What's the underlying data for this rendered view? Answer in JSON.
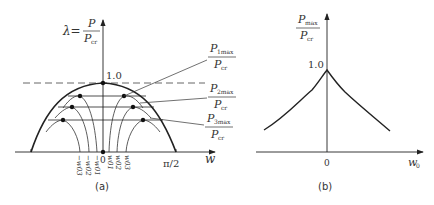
{
  "panel_a": {
    "caption": "(a)",
    "y_axis_label": {
      "lhs": "λ=",
      "num": "P",
      "den": "P",
      "den_sub": "cr"
    },
    "x_axis_label": "w",
    "peak_value_label": "1.0",
    "x_right_tick_label": "π/2",
    "origin_label": "0",
    "w0_tick_labels_negative": [
      "−w03",
      "−w02",
      "−w01"
    ],
    "w0_tick_labels_positive": [
      "w01",
      "w02",
      "w03"
    ],
    "w0_tick_label_base": "w",
    "w0_tick_subs": [
      "03",
      "02",
      "01",
      "01",
      "02",
      "03"
    ],
    "callouts": [
      {
        "num": "P",
        "num_sub": "1max",
        "den": "P",
        "den_sub": "cr"
      },
      {
        "num": "P",
        "num_sub": "2max",
        "den": "P",
        "den_sub": "cr"
      },
      {
        "num": "P",
        "num_sub": "3max",
        "den": "P",
        "den_sub": "cr"
      }
    ]
  },
  "panel_b": {
    "caption": "(b)",
    "y_axis_label": {
      "num": "P",
      "num_sub": "max",
      "den": "P",
      "den_sub": "cr"
    },
    "x_axis_label": "w",
    "x_axis_label_sub": "0",
    "peak_value_label": "1.0",
    "origin_label": "0"
  },
  "colors": {
    "line": "#222222",
    "text": "#333333",
    "dash": "#555555"
  }
}
